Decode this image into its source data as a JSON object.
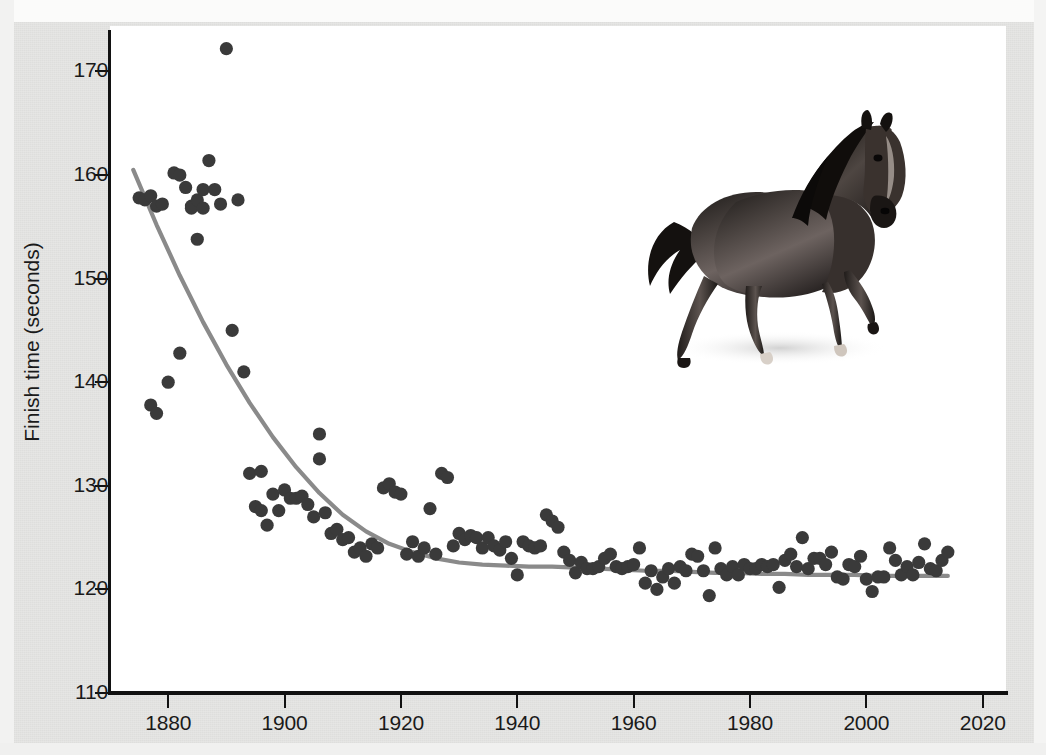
{
  "figure": {
    "background_color": "#e6e6e4",
    "panel_color": "#ffffff",
    "point_color": "#3a3a3a",
    "trend_color": "#8a8a8a",
    "axis_color": "#121212"
  },
  "axes": {
    "ylabel": "Finish time (seconds)",
    "xlabel": "",
    "yticks": [
      110,
      120,
      130,
      140,
      150,
      160,
      170
    ],
    "ytick_labels": [
      "110",
      "120",
      "130",
      "140",
      "150",
      "160",
      "170"
    ],
    "xticks": [
      1880,
      1900,
      1920,
      1940,
      1960,
      1980,
      2000,
      2020
    ],
    "xtick_labels": [
      "1880",
      "1900",
      "1920",
      "1940",
      "1960",
      "1980",
      "2000",
      "2020"
    ],
    "xlim": [
      1870,
      2024
    ],
    "ylim": [
      110,
      174
    ]
  },
  "decoration": {
    "horse_image_name": "galloping-horse-illustration",
    "horse_alt": "Dark bay galloping horse"
  },
  "chart_data": {
    "type": "scatter",
    "title": "",
    "subtitle": "",
    "xlabel": "",
    "ylabel": "Finish time (seconds)",
    "xlim": [
      1870,
      2024
    ],
    "ylim": [
      110,
      174
    ],
    "grid": false,
    "legend": null,
    "annotations": [],
    "series": [
      {
        "name": "Winning finish time",
        "type": "scatter",
        "marker": "circle",
        "color": "#3a3a3a",
        "points": [
          [
            1875,
            157.8
          ],
          [
            1876,
            157.6
          ],
          [
            1877,
            158.0
          ],
          [
            1877,
            137.8
          ],
          [
            1878,
            157.0
          ],
          [
            1878,
            137.0
          ],
          [
            1879,
            157.2
          ],
          [
            1880,
            140.0
          ],
          [
            1881,
            160.2
          ],
          [
            1882,
            160.0
          ],
          [
            1882,
            142.8
          ],
          [
            1883,
            158.8
          ],
          [
            1884,
            157.0
          ],
          [
            1884,
            156.8
          ],
          [
            1885,
            157.6
          ],
          [
            1885,
            153.8
          ],
          [
            1886,
            158.6
          ],
          [
            1886,
            156.8
          ],
          [
            1887,
            161.4
          ],
          [
            1888,
            158.6
          ],
          [
            1889,
            157.2
          ],
          [
            1890,
            172.2
          ],
          [
            1891,
            145.0
          ],
          [
            1892,
            157.6
          ],
          [
            1893,
            141.0
          ],
          [
            1894,
            131.2
          ],
          [
            1895,
            128.0
          ],
          [
            1896,
            127.6
          ],
          [
            1896,
            131.4
          ],
          [
            1897,
            126.2
          ],
          [
            1898,
            129.2
          ],
          [
            1899,
            127.6
          ],
          [
            1900,
            129.6
          ],
          [
            1901,
            128.8
          ],
          [
            1902,
            128.8
          ],
          [
            1903,
            129.0
          ],
          [
            1904,
            128.2
          ],
          [
            1905,
            127.0
          ],
          [
            1906,
            135.0
          ],
          [
            1906,
            132.6
          ],
          [
            1907,
            127.4
          ],
          [
            1908,
            125.4
          ],
          [
            1909,
            125.8
          ],
          [
            1910,
            124.8
          ],
          [
            1911,
            125.0
          ],
          [
            1912,
            123.6
          ],
          [
            1913,
            124.0
          ],
          [
            1914,
            123.2
          ],
          [
            1915,
            124.4
          ],
          [
            1916,
            124.0
          ],
          [
            1917,
            129.8
          ],
          [
            1918,
            130.2
          ],
          [
            1919,
            129.4
          ],
          [
            1920,
            129.2
          ],
          [
            1921,
            123.4
          ],
          [
            1922,
            124.6
          ],
          [
            1923,
            123.2
          ],
          [
            1924,
            124.0
          ],
          [
            1925,
            127.8
          ],
          [
            1926,
            123.4
          ],
          [
            1927,
            131.2
          ],
          [
            1928,
            130.8
          ],
          [
            1929,
            124.2
          ],
          [
            1930,
            125.4
          ],
          [
            1931,
            124.8
          ],
          [
            1932,
            125.2
          ],
          [
            1933,
            125.0
          ],
          [
            1934,
            124.0
          ],
          [
            1935,
            125.0
          ],
          [
            1936,
            124.2
          ],
          [
            1937,
            123.8
          ],
          [
            1938,
            124.6
          ],
          [
            1939,
            123.0
          ],
          [
            1940,
            121.4
          ],
          [
            1941,
            124.6
          ],
          [
            1942,
            124.2
          ],
          [
            1943,
            124.0
          ],
          [
            1944,
            124.2
          ],
          [
            1945,
            127.2
          ],
          [
            1946,
            126.6
          ],
          [
            1947,
            126.0
          ],
          [
            1948,
            123.6
          ],
          [
            1949,
            122.8
          ],
          [
            1950,
            121.6
          ],
          [
            1951,
            122.6
          ],
          [
            1952,
            122.0
          ],
          [
            1953,
            122.0
          ],
          [
            1954,
            122.2
          ],
          [
            1955,
            123.0
          ],
          [
            1956,
            123.4
          ],
          [
            1957,
            122.2
          ],
          [
            1958,
            122.0
          ],
          [
            1959,
            122.2
          ],
          [
            1960,
            122.4
          ],
          [
            1961,
            124.0
          ],
          [
            1962,
            120.6
          ],
          [
            1963,
            121.8
          ],
          [
            1964,
            120.0
          ],
          [
            1965,
            121.2
          ],
          [
            1966,
            122.0
          ],
          [
            1967,
            120.6
          ],
          [
            1968,
            122.2
          ],
          [
            1969,
            121.8
          ],
          [
            1970,
            123.4
          ],
          [
            1971,
            123.2
          ],
          [
            1972,
            121.8
          ],
          [
            1973,
            119.4
          ],
          [
            1974,
            124.0
          ],
          [
            1975,
            122.0
          ],
          [
            1976,
            121.4
          ],
          [
            1977,
            122.2
          ],
          [
            1978,
            121.4
          ],
          [
            1979,
            122.4
          ],
          [
            1980,
            122.0
          ],
          [
            1981,
            122.0
          ],
          [
            1982,
            122.4
          ],
          [
            1983,
            122.2
          ],
          [
            1984,
            122.4
          ],
          [
            1985,
            120.2
          ],
          [
            1986,
            122.8
          ],
          [
            1987,
            123.4
          ],
          [
            1988,
            122.2
          ],
          [
            1989,
            125.0
          ],
          [
            1990,
            122.0
          ],
          [
            1991,
            123.0
          ],
          [
            1992,
            123.0
          ],
          [
            1993,
            122.4
          ],
          [
            1994,
            123.6
          ],
          [
            1995,
            121.2
          ],
          [
            1996,
            121.0
          ],
          [
            1997,
            122.4
          ],
          [
            1998,
            122.2
          ],
          [
            1999,
            123.2
          ],
          [
            2000,
            121.0
          ],
          [
            2001,
            119.8
          ],
          [
            2002,
            121.2
          ],
          [
            2003,
            121.2
          ],
          [
            2004,
            124.0
          ],
          [
            2005,
            122.8
          ],
          [
            2006,
            121.4
          ],
          [
            2007,
            122.2
          ],
          [
            2008,
            121.4
          ],
          [
            2009,
            122.6
          ],
          [
            2010,
            124.4
          ],
          [
            2011,
            122.0
          ],
          [
            2012,
            121.8
          ],
          [
            2013,
            122.8
          ],
          [
            2014,
            123.6
          ]
        ]
      },
      {
        "name": "Fitted trend",
        "type": "line",
        "color": "#8a8a8a",
        "points": [
          [
            1874,
            160.5
          ],
          [
            1878,
            155.2
          ],
          [
            1882,
            150.3
          ],
          [
            1886,
            145.8
          ],
          [
            1890,
            141.7
          ],
          [
            1894,
            138.0
          ],
          [
            1898,
            134.7
          ],
          [
            1902,
            131.8
          ],
          [
            1906,
            129.3
          ],
          [
            1910,
            127.2
          ],
          [
            1914,
            125.6
          ],
          [
            1918,
            124.4
          ],
          [
            1922,
            123.6
          ],
          [
            1926,
            123.0
          ],
          [
            1930,
            122.6
          ],
          [
            1934,
            122.4
          ],
          [
            1938,
            122.3
          ],
          [
            1942,
            122.2
          ],
          [
            1946,
            122.2
          ],
          [
            1950,
            122.1
          ],
          [
            1954,
            122.0
          ],
          [
            1958,
            121.9
          ],
          [
            1962,
            121.8
          ],
          [
            1966,
            121.8
          ],
          [
            1970,
            121.7
          ],
          [
            1974,
            121.6
          ],
          [
            1978,
            121.6
          ],
          [
            1982,
            121.5
          ],
          [
            1986,
            121.5
          ],
          [
            1990,
            121.4
          ],
          [
            1994,
            121.4
          ],
          [
            1998,
            121.4
          ],
          [
            2002,
            121.3
          ],
          [
            2006,
            121.3
          ],
          [
            2010,
            121.3
          ],
          [
            2014,
            121.3
          ]
        ]
      }
    ]
  }
}
